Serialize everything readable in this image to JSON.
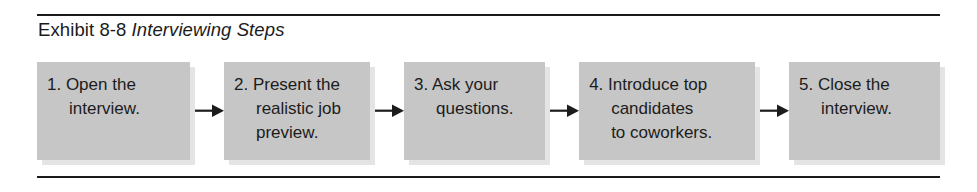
{
  "exhibit": {
    "label": "Exhibit 8-8",
    "subject": "Interviewing Steps"
  },
  "flow": {
    "arrow_icon": "arrow-right-icon",
    "steps": [
      {
        "number": "1.",
        "text": "1. Open the\ninterview."
      },
      {
        "number": "2.",
        "text": "2. Present the\nrealistic job\npreview."
      },
      {
        "number": "3.",
        "text": "3. Ask your\nquestions."
      },
      {
        "number": "4.",
        "text": "4. Introduce top\ncandidates\nto coworkers."
      },
      {
        "number": "5.",
        "text": "5. Close the\ninterview."
      }
    ]
  },
  "colors": {
    "box_fill": "#c6c6c6",
    "box_shadow": "#e4e4e4",
    "rule": "#1a1a1a",
    "text": "#1c1c1c",
    "background": "#ffffff"
  }
}
